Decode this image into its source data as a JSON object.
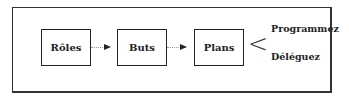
{
  "diagram": {
    "nodes": [
      {
        "id": "roles",
        "label": "Rôles"
      },
      {
        "id": "buts",
        "label": "Buts"
      },
      {
        "id": "plans",
        "label": "Plans"
      }
    ],
    "edges": [
      {
        "from": "roles",
        "to": "buts"
      },
      {
        "from": "buts",
        "to": "plans"
      }
    ],
    "branch_symbol": "<",
    "branch_options": [
      "Programmez",
      "Déléguez"
    ]
  }
}
